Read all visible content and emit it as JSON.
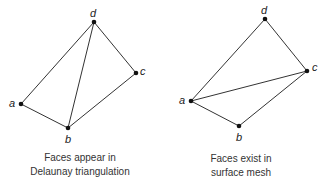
{
  "diagrams": [
    {
      "caption": [
        "Faces appear in",
        "Delaunay triangulation"
      ],
      "points": {
        "a": "a",
        "b": "b",
        "c": "c",
        "d": "d"
      },
      "edges": [
        "a-d",
        "d-c",
        "c-b",
        "b-a",
        "b-d"
      ]
    },
    {
      "caption": [
        "Faces exist in",
        "surface mesh"
      ],
      "points": {
        "a": "a",
        "b": "b",
        "c": "c",
        "d": "d"
      },
      "edges": [
        "a-d",
        "d-c",
        "c-b",
        "b-a",
        "a-c"
      ]
    }
  ],
  "colors": {
    "line": "#333333",
    "point": "#111111"
  }
}
